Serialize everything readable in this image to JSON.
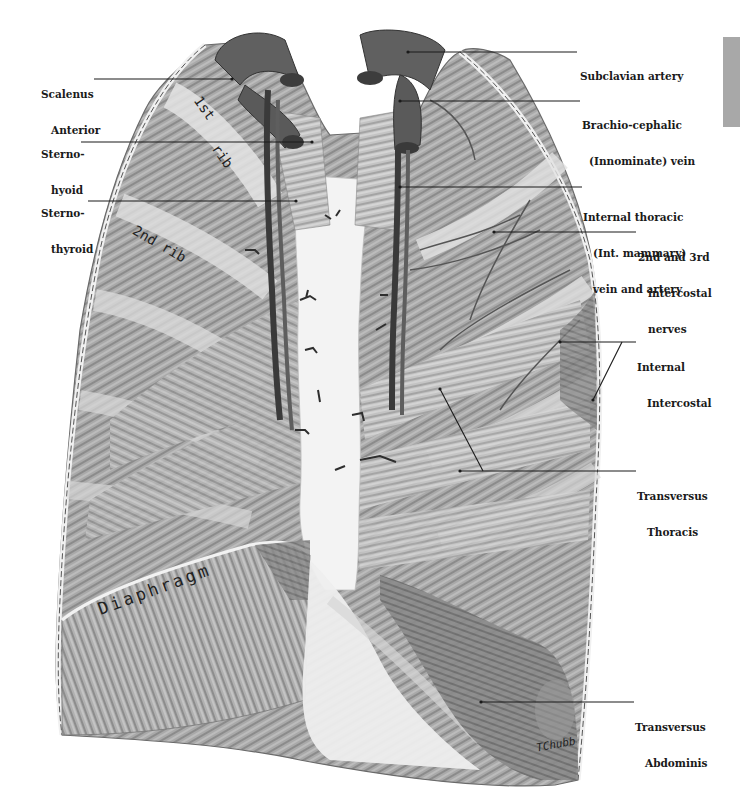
{
  "figure": {
    "style": "monochrome pencil anatomical illustration",
    "colors": {
      "background": "#ffffff",
      "ink": "#1a1a1a",
      "muscle_mid": "#9a9a9a",
      "muscle_dark": "#555555",
      "vessel": "#3a3a3a",
      "sternum": "#f2f2f2",
      "tab_marker": "#a8a8a8"
    }
  },
  "labels_left": [
    {
      "id": "scalenus-anterior",
      "lines": [
        "Scalenus",
        "Anterior"
      ]
    },
    {
      "id": "sterno-hyoid",
      "lines": [
        "Sterno-",
        "hyoid"
      ]
    },
    {
      "id": "sterno-thyroid",
      "lines": [
        "Sterno-",
        "thyroid"
      ]
    }
  ],
  "labels_right": [
    {
      "id": "subclavian-artery",
      "lines": [
        "Subclavian artery"
      ]
    },
    {
      "id": "brachiocephalic-vein",
      "lines": [
        "Brachio-cephalic",
        "(Innominate) vein"
      ]
    },
    {
      "id": "internal-thoracic",
      "lines": [
        "Internal thoracic",
        "(Int. mammary)",
        "vein and artery"
      ]
    },
    {
      "id": "intercostal-nerves",
      "lines": [
        "2nd and 3rd",
        "intercostal",
        "nerves"
      ]
    },
    {
      "id": "internal-intercostal",
      "lines": [
        "Internal",
        "Intercostal"
      ]
    },
    {
      "id": "transversus-thoracis",
      "lines": [
        "Transversus",
        "Thoracis"
      ]
    },
    {
      "id": "transversus-abdominis",
      "lines": [
        "Transversus",
        "Abdominis"
      ]
    }
  ],
  "inline_text": {
    "first_rib_a": "1st",
    "first_rib_b": "rib",
    "second_rib": "2nd rib",
    "diaphragm": "Diaphragm",
    "signature": "TChubb"
  }
}
